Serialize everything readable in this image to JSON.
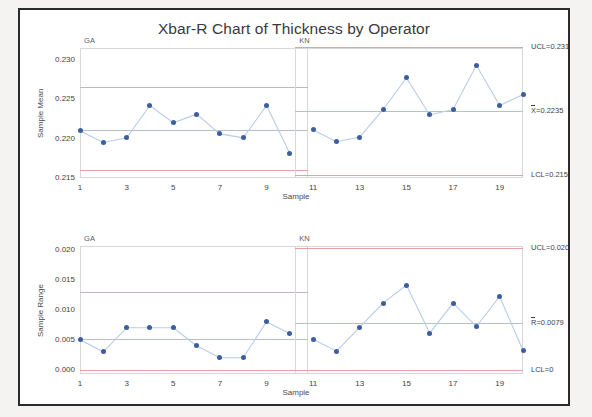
{
  "title": "Xbar-R Chart of Thickness by Operator",
  "panels": [
    {
      "id": "GA",
      "label": "GA"
    },
    {
      "id": "KN",
      "label": "KN"
    }
  ],
  "axis": {
    "xlabel": "Sample"
  },
  "colors": {
    "point": "#3b5e9e",
    "line": "#b7cbe8",
    "control_limit": "#e8a0a0",
    "center_line": "#a8cdb0",
    "stage_line": "#b9b9d6",
    "frame": "#2b2b2e",
    "text": "#3f3f44"
  },
  "chart_data": [
    {
      "type": "line",
      "id": "xbar",
      "title": "Xbar-R Chart of Thickness by Operator",
      "subtitle": "Xbar chart",
      "xlabel": "Sample",
      "ylabel": "Sample Mean",
      "ylim": [
        0.215,
        0.2315
      ],
      "yticks": [
        0.215,
        0.22,
        0.225,
        0.23
      ],
      "ytick_labels": [
        "0.215",
        "0.220",
        "0.225",
        "0.230"
      ],
      "xlim": [
        1,
        20
      ],
      "xticks": [
        1,
        3,
        5,
        7,
        9,
        11,
        13,
        15,
        17,
        19
      ],
      "xtick_labels": [
        "1",
        "3",
        "5",
        "7",
        "9",
        "11",
        "13",
        "15",
        "17",
        "19"
      ],
      "grid": false,
      "legend": "none",
      "x": [
        1,
        2,
        3,
        4,
        5,
        6,
        7,
        8,
        9,
        10,
        11,
        12,
        13,
        14,
        15,
        16,
        17,
        18,
        19,
        20
      ],
      "values": [
        0.221,
        0.2195,
        0.2201,
        0.2242,
        0.222,
        0.2231,
        0.2206,
        0.2201,
        0.2242,
        0.2181,
        0.2211,
        0.2196,
        0.2202,
        0.2237,
        0.2277,
        0.223,
        0.2237,
        0.2293,
        0.2242,
        0.2256
      ],
      "stages": [
        {
          "name": "GA",
          "x_from": 1,
          "x_to": 10,
          "UCL": 0.2265,
          "CL": 0.2211,
          "LCL": 0.216,
          "ucl_label": "",
          "cl_label": "",
          "lcl_label": ""
        },
        {
          "name": "KN",
          "x_from": 11,
          "x_to": 20,
          "UCL": 0.23158,
          "CL": 0.2235,
          "LCL": 0.21542,
          "ucl_label": "UCL=0.23158",
          "cl_label": "X=0.2235",
          "lcl_label": "LCL=0.21542"
        }
      ],
      "annotations": [
        {
          "text": "UCL=0.23158",
          "value": 0.23158
        },
        {
          "text": "X=0.2235",
          "value": 0.2235
        },
        {
          "text": "LCL=0.21542",
          "value": 0.21542
        }
      ]
    },
    {
      "type": "line",
      "id": "range",
      "title": "Xbar-R Chart of Thickness by Operator",
      "subtitle": "R chart",
      "xlabel": "Sample",
      "ylabel": "Sample Range",
      "ylim": [
        -0.0006,
        0.0207
      ],
      "yticks": [
        0.0,
        0.005,
        0.01,
        0.015,
        0.02
      ],
      "ytick_labels": [
        "0.000",
        "0.005",
        "0.010",
        "0.015",
        "0.020"
      ],
      "xlim": [
        1,
        20
      ],
      "xticks": [
        1,
        3,
        5,
        7,
        9,
        11,
        13,
        15,
        17,
        19
      ],
      "xtick_labels": [
        "1",
        "3",
        "5",
        "7",
        "9",
        "11",
        "13",
        "15",
        "17",
        "19"
      ],
      "grid": false,
      "legend": "none",
      "x": [
        1,
        2,
        3,
        4,
        5,
        6,
        7,
        8,
        9,
        10,
        11,
        12,
        13,
        14,
        15,
        16,
        17,
        18,
        19,
        20
      ],
      "values": [
        0.0051,
        0.0031,
        0.0071,
        0.0071,
        0.0071,
        0.0041,
        0.0021,
        0.0021,
        0.0081,
        0.0061,
        0.0052,
        0.0032,
        0.0072,
        0.0112,
        0.0142,
        0.0062,
        0.0112,
        0.0073,
        0.0123,
        0.0033
      ],
      "stages": [
        {
          "name": "GA",
          "x_from": 1,
          "x_to": 10,
          "UCL": 0.0131,
          "CL": 0.0052,
          "LCL": 0.0,
          "ucl_label": "",
          "cl_label": "",
          "lcl_label": ""
        },
        {
          "name": "KN",
          "x_from": 11,
          "x_to": 20,
          "UCL": 0.02034,
          "CL": 0.0079,
          "LCL": 0.0,
          "ucl_label": "UCL=0.02034",
          "cl_label": "R=0.0079",
          "lcl_label": "LCL=0"
        }
      ],
      "annotations": [
        {
          "text": "UCL=0.02034",
          "value": 0.02034
        },
        {
          "text": "R=0.0079",
          "value": 0.0079
        },
        {
          "text": "LCL=0",
          "value": 0.0
        }
      ]
    }
  ]
}
